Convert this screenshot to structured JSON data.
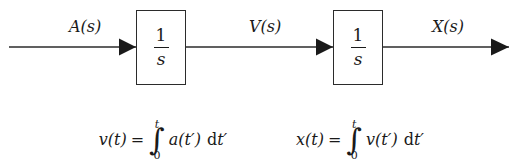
{
  "diagram": {
    "background_color": "#ffffff",
    "line_color": "#2b2b2b",
    "text_color": "#1a1a1a",
    "signals": [
      {
        "name": "input-signal-label",
        "label": "A(s)"
      },
      {
        "name": "middle-signal-label",
        "label": "V(s)"
      },
      {
        "name": "output-signal-label",
        "label": "X(s)"
      }
    ],
    "blocks": [
      {
        "name": "integrator-block-1",
        "numerator": "1",
        "denominator": "s"
      },
      {
        "name": "integrator-block-2",
        "numerator": "1",
        "denominator": "s"
      }
    ],
    "equations": [
      {
        "name": "velocity-integral-equation",
        "lhs": "v(t)",
        "equals": "=",
        "integral_sign": "∫",
        "upper_limit": "t",
        "lower_limit": "0",
        "integrand": "a(t′)",
        "differential_d": "d",
        "differential_var": "t′"
      },
      {
        "name": "position-integral-equation",
        "lhs": "x(t)",
        "equals": "=",
        "integral_sign": "∫",
        "upper_limit": "t",
        "lower_limit": "0",
        "integrand": "v(t′)",
        "differential_d": "d",
        "differential_var": "t′"
      }
    ]
  }
}
